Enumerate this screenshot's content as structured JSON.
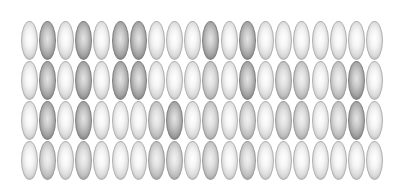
{
  "figure": {
    "rows": 4,
    "columns": 20,
    "shade_legend": {
      "0": "light",
      "1": "medium",
      "2": "dark"
    },
    "colors": {
      "background": "#ffffff",
      "light_fill": "#f4f4f4",
      "medium_fill": "#dedede",
      "dark_fill": "#c6c6c6",
      "outline": "#a9a9a9"
    },
    "shade_grid": [
      [
        0,
        2,
        0,
        2,
        0,
        2,
        2,
        0,
        0,
        0,
        2,
        0,
        2,
        0,
        0,
        0,
        0,
        0,
        0,
        0
      ],
      [
        0,
        2,
        0,
        2,
        0,
        2,
        2,
        0,
        0,
        0,
        1,
        0,
        2,
        0,
        1,
        1,
        0,
        1,
        2,
        0
      ],
      [
        0,
        2,
        0,
        2,
        0,
        0,
        0,
        1,
        2,
        0,
        1,
        0,
        1,
        0,
        1,
        1,
        0,
        1,
        2,
        0
      ],
      [
        0,
        1,
        0,
        1,
        0,
        0,
        0,
        1,
        1,
        0,
        1,
        0,
        1,
        0,
        0,
        0,
        0,
        0,
        0,
        0
      ]
    ]
  }
}
